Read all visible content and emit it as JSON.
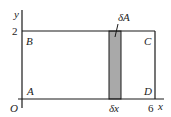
{
  "diagram": {
    "axes": {
      "origin_label": "O",
      "x_label": "x",
      "y_label": "y",
      "x_tick_label": "6",
      "y_tick_label": "2"
    },
    "corners": {
      "A": "A",
      "B": "B",
      "C": "C",
      "D": "D"
    },
    "strip": {
      "area_label": "δA",
      "width_label": "δx",
      "fill_color": "#a9a9a9"
    },
    "colors": {
      "line": "#1a1a1a",
      "background": "#ffffff"
    }
  }
}
